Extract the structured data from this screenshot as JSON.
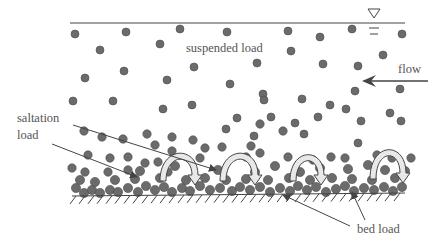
{
  "diagram": {
    "colors": {
      "particle": "#6b6b6b",
      "particle_stroke": "#4a4a4a",
      "line": "#444444",
      "label": "#555555",
      "hop_arrow_fill": "#e8e8e8"
    },
    "labels": {
      "suspended": {
        "text": "suspended load",
        "x": 186,
        "y": 52
      },
      "flow": {
        "text": "flow",
        "x": 398,
        "y": 73
      },
      "saltation_line1": {
        "text": "saltation",
        "x": 17,
        "y": 122
      },
      "saltation_line2": {
        "text": "load",
        "x": 17,
        "y": 139
      },
      "bed": {
        "text": "bed load",
        "x": 357,
        "y": 233
      }
    },
    "water_surface": {
      "x1": 70,
      "y1": 23,
      "x2": 405,
      "y2": 23,
      "symbol_x": 374,
      "symbol_y": 14
    },
    "flow_arrow": {
      "x1": 428,
      "y1": 81,
      "x2": 362,
      "y2": 81
    },
    "suspended_particles": [
      [
        75,
        34
      ],
      [
        126,
        32
      ],
      [
        180,
        29
      ],
      [
        100,
        50
      ],
      [
        160,
        44
      ],
      [
        194,
        67
      ],
      [
        85,
        78
      ],
      [
        124,
        71
      ],
      [
        167,
        80
      ],
      [
        73,
        101
      ],
      [
        113,
        101
      ],
      [
        163,
        109
      ],
      [
        192,
        105
      ],
      [
        227,
        32
      ],
      [
        288,
        31
      ],
      [
        320,
        37
      ],
      [
        352,
        29
      ],
      [
        402,
        34
      ],
      [
        291,
        51
      ],
      [
        383,
        55
      ],
      [
        257,
        63
      ],
      [
        323,
        64
      ],
      [
        358,
        66
      ],
      [
        230,
        84
      ],
      [
        263,
        94
      ],
      [
        302,
        99
      ],
      [
        355,
        91
      ],
      [
        400,
        89
      ],
      [
        237,
        118
      ],
      [
        271,
        117
      ],
      [
        295,
        123
      ],
      [
        318,
        117
      ],
      [
        346,
        109
      ],
      [
        361,
        121
      ],
      [
        390,
        113
      ],
      [
        226,
        129
      ],
      [
        254,
        136
      ],
      [
        264,
        100
      ],
      [
        304,
        134
      ],
      [
        330,
        105
      ],
      [
        401,
        121
      ],
      [
        358,
        143
      ]
    ],
    "saltation_particles": [
      [
        84,
        131
      ],
      [
        102,
        137
      ],
      [
        123,
        139
      ],
      [
        147,
        134
      ],
      [
        172,
        137
      ],
      [
        193,
        140
      ],
      [
        205,
        148
      ],
      [
        88,
        155
      ],
      [
        110,
        158
      ],
      [
        128,
        157
      ],
      [
        155,
        145
      ],
      [
        172,
        151
      ],
      [
        200,
        158
      ],
      [
        72,
        168
      ],
      [
        85,
        172
      ],
      [
        108,
        172
      ],
      [
        128,
        170
      ],
      [
        145,
        163
      ],
      [
        158,
        162
      ],
      [
        168,
        172
      ],
      [
        222,
        147
      ],
      [
        251,
        146
      ],
      [
        260,
        153
      ],
      [
        288,
        157
      ],
      [
        313,
        160
      ],
      [
        331,
        157
      ],
      [
        345,
        158
      ],
      [
        260,
        124
      ],
      [
        283,
        131
      ],
      [
        246,
        157
      ],
      [
        377,
        155
      ],
      [
        392,
        158
      ],
      [
        411,
        158
      ]
    ],
    "bed_particles": [
      [
        76,
        188
      ],
      [
        84,
        193
      ],
      [
        92,
        190
      ],
      [
        100,
        193
      ],
      [
        110,
        190
      ],
      [
        118,
        192
      ],
      [
        128,
        188
      ],
      [
        138,
        192
      ],
      [
        146,
        186
      ],
      [
        155,
        190
      ],
      [
        164,
        187
      ],
      [
        172,
        192
      ],
      [
        182,
        188
      ],
      [
        190,
        191
      ],
      [
        200,
        186
      ],
      [
        210,
        190
      ],
      [
        220,
        188
      ],
      [
        232,
        191
      ],
      [
        240,
        187
      ],
      [
        250,
        190
      ],
      [
        260,
        187
      ],
      [
        270,
        192
      ],
      [
        280,
        188
      ],
      [
        290,
        191
      ],
      [
        298,
        186
      ],
      [
        307,
        190
      ],
      [
        316,
        187
      ],
      [
        326,
        192
      ],
      [
        336,
        189
      ],
      [
        345,
        186
      ],
      [
        354,
        191
      ],
      [
        364,
        188
      ],
      [
        374,
        190
      ],
      [
        384,
        187
      ],
      [
        393,
        191
      ],
      [
        402,
        187
      ],
      [
        80,
        180
      ],
      [
        95,
        182
      ],
      [
        115,
        180
      ],
      [
        135,
        179
      ],
      [
        160,
        178
      ],
      [
        186,
        180
      ],
      [
        205,
        178
      ],
      [
        226,
        180
      ],
      [
        246,
        179
      ],
      [
        268,
        180
      ],
      [
        289,
        178
      ],
      [
        310,
        180
      ],
      [
        332,
        178
      ],
      [
        352,
        179
      ],
      [
        372,
        180
      ],
      [
        395,
        178
      ],
      [
        140,
        171
      ],
      [
        175,
        166
      ],
      [
        218,
        170
      ],
      [
        255,
        172
      ],
      [
        275,
        166
      ],
      [
        300,
        172
      ],
      [
        320,
        168
      ],
      [
        348,
        169
      ],
      [
        368,
        165
      ],
      [
        385,
        170
      ],
      [
        405,
        171
      ]
    ],
    "hop_arrows": [
      {
        "x": 160,
        "y": 185,
        "w": 38,
        "h": 40
      },
      {
        "x": 220,
        "y": 185,
        "w": 38,
        "h": 40
      },
      {
        "x": 290,
        "y": 185,
        "w": 34,
        "h": 38
      },
      {
        "x": 370,
        "y": 183,
        "w": 36,
        "h": 42
      }
    ],
    "leaders": {
      "saltation_upper": {
        "x1": 73,
        "y1": 125,
        "x2": 216,
        "y2": 170
      },
      "saltation_lower": {
        "x1": 52,
        "y1": 144,
        "x2": 137,
        "y2": 177
      },
      "bed_left": {
        "x1": 350,
        "y1": 226,
        "x2": 283,
        "y2": 195
      },
      "bed_right": {
        "x1": 365,
        "y1": 220,
        "x2": 352,
        "y2": 192
      }
    },
    "bed": {
      "x1": 72,
      "y1": 196,
      "x2": 405,
      "y2": 193
    }
  }
}
